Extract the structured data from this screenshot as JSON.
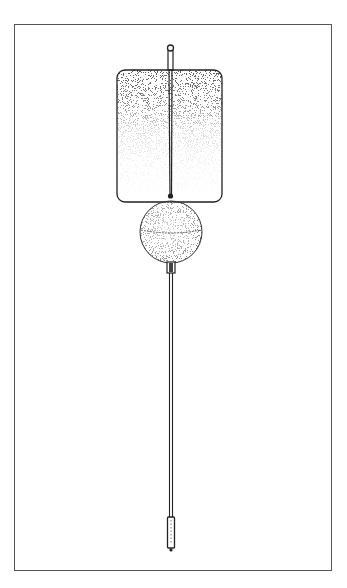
{
  "figure": {
    "type": "technical-illustration",
    "caption": "",
    "colors": {
      "frame": "#555555",
      "line": "#222222",
      "stipple_dark": "#3a3a3a",
      "background": "#ffffff"
    },
    "parts": [
      {
        "name": "top-knob"
      },
      {
        "name": "flag-panel"
      },
      {
        "name": "center-rod"
      },
      {
        "name": "sphere-float"
      },
      {
        "name": "collar"
      },
      {
        "name": "lower-rod"
      },
      {
        "name": "bottom-weight"
      }
    ]
  }
}
